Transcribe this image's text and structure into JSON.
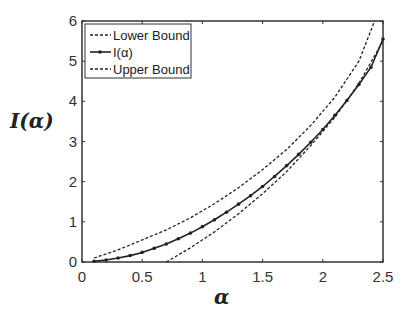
{
  "chart_data": {
    "type": "line",
    "title": "",
    "xlabel": "α",
    "ylabel": "I(α)",
    "xlim": [
      0,
      2.5
    ],
    "ylim": [
      0,
      6
    ],
    "xticks": [
      "0",
      "0.5",
      "1",
      "1.5",
      "2",
      "2.5"
    ],
    "yticks": [
      "0",
      "1",
      "2",
      "3",
      "4",
      "5",
      "6"
    ],
    "grid": false,
    "legend_position": "upper left",
    "series": [
      {
        "name": "Lower Bound",
        "style": "dashed",
        "x": [
          0.7,
          0.9,
          1.1,
          1.3,
          1.5,
          1.7,
          1.9,
          2.1,
          2.3,
          2.5
        ],
        "y": [
          0.0,
          0.35,
          0.75,
          1.2,
          1.7,
          2.25,
          2.9,
          3.6,
          4.45,
          5.5
        ]
      },
      {
        "name": "I(α)",
        "style": "solid-marker",
        "x": [
          0.1,
          0.2,
          0.3,
          0.4,
          0.5,
          0.6,
          0.7,
          0.8,
          0.9,
          1.0,
          1.1,
          1.2,
          1.3,
          1.4,
          1.5,
          1.6,
          1.7,
          1.8,
          1.9,
          2.0,
          2.1,
          2.2,
          2.3,
          2.4,
          2.5
        ],
        "y": [
          0.02,
          0.05,
          0.1,
          0.16,
          0.24,
          0.34,
          0.45,
          0.58,
          0.72,
          0.88,
          1.05,
          1.24,
          1.44,
          1.65,
          1.88,
          2.13,
          2.4,
          2.68,
          2.98,
          3.3,
          3.65,
          4.02,
          4.42,
          4.85,
          5.55
        ]
      },
      {
        "name": "Upper Bound",
        "style": "dashed",
        "x": [
          0.1,
          0.3,
          0.5,
          0.7,
          0.9,
          1.1,
          1.3,
          1.5,
          1.7,
          1.9,
          2.1,
          2.3,
          2.43
        ],
        "y": [
          0.1,
          0.3,
          0.55,
          0.8,
          1.1,
          1.45,
          1.85,
          2.3,
          2.8,
          3.4,
          4.1,
          5.0,
          6.0
        ]
      }
    ]
  },
  "legend": {
    "items": [
      "Lower Bound",
      "I(α)",
      "Upper Bound"
    ]
  }
}
